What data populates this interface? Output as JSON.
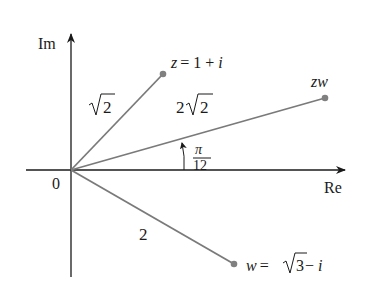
{
  "axes": {
    "real_label": "Re",
    "imag_label": "Im",
    "origin_label": "0"
  },
  "points": {
    "z": {
      "label_var": "z",
      "label_eq": "= 1 + ",
      "label_i": "i"
    },
    "w": {
      "label_var": "w",
      "label_eq": "= ",
      "label_sqrt_num": "3",
      "label_tail": " − ",
      "label_i": "i"
    },
    "zw": {
      "label": "zw"
    }
  },
  "lengths": {
    "z_modulus_radicand": "2",
    "zw_modulus_coeff": "2",
    "zw_modulus_radicand": "2",
    "w_modulus": "2"
  },
  "angle": {
    "numerator": "π",
    "denominator": "12"
  },
  "colors": {
    "axis": "#1a1a1a",
    "vector": "#7a7a7a",
    "point": "#808080"
  }
}
